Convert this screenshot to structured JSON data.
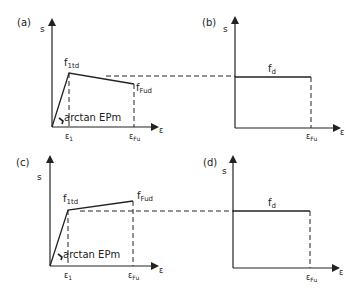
{
  "figure": {
    "panels": [
      {
        "id": "a",
        "label": "(a)",
        "y_axis": "s",
        "x_axis": "ε",
        "peak_label": "f",
        "peak_sub": "1td",
        "end_label": "f",
        "end_sub": "Fud",
        "slope_label": "arctan EPm",
        "x_tick1": "ε",
        "x_tick1_sub": "1",
        "x_tick2": "ε",
        "x_tick2_sub": "Fu",
        "behavior": "softening"
      },
      {
        "id": "b",
        "label": "(b)",
        "y_axis": "s",
        "x_axis": "ε",
        "level_label": "f",
        "level_sub": "d",
        "x_tick": "ε",
        "x_tick_sub": "Fu",
        "behavior": "rigid-plastic"
      },
      {
        "id": "c",
        "label": "(c)",
        "y_axis": "s",
        "x_axis": "ε",
        "peak_label": "f",
        "peak_sub": "1td",
        "end_label": "f",
        "end_sub": "Fud",
        "slope_label": "arctan EPm",
        "x_tick1": "ε",
        "x_tick1_sub": "1",
        "x_tick2": "ε",
        "x_tick2_sub": "Fu",
        "behavior": "hardening"
      },
      {
        "id": "d",
        "label": "(d)",
        "y_axis": "s",
        "x_axis": "ε",
        "level_label": "f",
        "level_sub": "d",
        "x_tick": "ε",
        "x_tick_sub": "Fu",
        "behavior": "rigid-plastic"
      }
    ],
    "colors": {
      "line": "#222222",
      "background": "#ffffff"
    }
  }
}
